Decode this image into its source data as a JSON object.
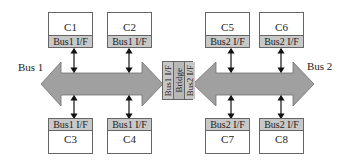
{
  "diagram": {
    "buses": [
      {
        "label": "Bus 1",
        "color": "#a0a0a0"
      },
      {
        "label": "Bus 2",
        "color": "#a0a0a0"
      }
    ],
    "bridge": {
      "sections": [
        "Bus1 I/F",
        "Bridge",
        "Bus2 I/F"
      ]
    },
    "components": {
      "c1": {
        "name": "C1",
        "iface": "Bus1 I/F"
      },
      "c2": {
        "name": "C2",
        "iface": "Bus1 I/F"
      },
      "c3": {
        "name": "C3",
        "iface": "Bus1 I/F"
      },
      "c4": {
        "name": "C4",
        "iface": "Bus1 I/F"
      },
      "c5": {
        "name": "C5",
        "iface": "Bus2 I/F"
      },
      "c6": {
        "name": "C6",
        "iface": "Bus2 I/F"
      },
      "c7": {
        "name": "C7",
        "iface": "Bus2 I/F"
      },
      "c8": {
        "name": "C8",
        "iface": "Bus2 I/F"
      }
    }
  }
}
